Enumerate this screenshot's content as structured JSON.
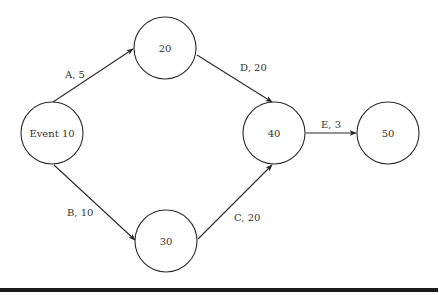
{
  "diagram": {
    "type": "activity-on-arrow network",
    "nodes": [
      {
        "id": "n10",
        "label": "Event 10"
      },
      {
        "id": "n20",
        "label": "20"
      },
      {
        "id": "n30",
        "label": "30"
      },
      {
        "id": "n40",
        "label": "40"
      },
      {
        "id": "n50",
        "label": "50"
      }
    ],
    "edges": [
      {
        "id": "A",
        "from": "n10",
        "to": "n20",
        "label": "A, 5",
        "activity": "A",
        "duration": 5
      },
      {
        "id": "B",
        "from": "n10",
        "to": "n30",
        "label": "B, 10",
        "activity": "B",
        "duration": 10
      },
      {
        "id": "C",
        "from": "n30",
        "to": "n40",
        "label": "C, 20",
        "activity": "C",
        "duration": 20
      },
      {
        "id": "D",
        "from": "n20",
        "to": "n40",
        "label": "D, 20",
        "activity": "D",
        "duration": 20
      },
      {
        "id": "E",
        "from": "n40",
        "to": "n50",
        "label": "E, 3",
        "activity": "E",
        "duration": 3
      }
    ],
    "colors": {
      "stroke": "#2a2a2a",
      "text": "#333333",
      "background": "#ffffff"
    }
  }
}
